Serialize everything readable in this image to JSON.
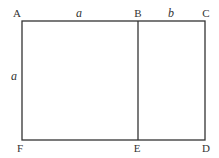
{
  "diagram": {
    "type": "golden-rectangle",
    "points": {
      "A": {
        "label": "A",
        "x": 22,
        "y": 21
      },
      "B": {
        "label": "B",
        "x": 138,
        "y": 21
      },
      "C": {
        "label": "C",
        "x": 205,
        "y": 21
      },
      "D": {
        "label": "D",
        "x": 205,
        "y": 140
      },
      "E": {
        "label": "E",
        "x": 138,
        "y": 140
      },
      "F": {
        "label": "F",
        "x": 22,
        "y": 140
      }
    },
    "segment_labels": {
      "AB": "a",
      "BC": "b",
      "AF": "a"
    },
    "line_color": "#333333"
  }
}
